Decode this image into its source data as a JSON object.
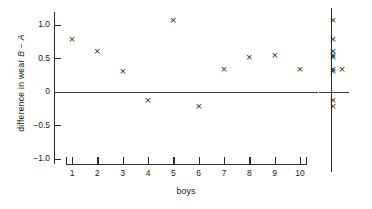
{
  "chart_data": {
    "type": "scatter",
    "title": "",
    "xlabel": "boys",
    "ylabel": "difference in wear B − A",
    "ylabel_parts": {
      "pre": "difference in wear ",
      "sym1": "B",
      "mid": " − ",
      "sym2": "A"
    },
    "categories": [
      "1",
      "2",
      "3",
      "4",
      "5",
      "6",
      "7",
      "8",
      "9",
      "10"
    ],
    "values": [
      0.78,
      0.6,
      0.3,
      -0.13,
      1.07,
      -0.22,
      0.33,
      0.52,
      0.55,
      0.33
    ],
    "xlim": [
      0.5,
      10.5
    ],
    "ylim": [
      -1.15,
      1.25
    ],
    "yticks": [
      1.0,
      0.5,
      0,
      -0.5,
      -1.0
    ],
    "ytick_labels": [
      "1.0",
      "0.5",
      "0",
      "−0.5",
      "−1.0"
    ],
    "grid": false,
    "legend": null,
    "marker_symbol": "×",
    "zero_reference_line": 0,
    "annotations": [],
    "summary_column": {
      "label": "",
      "description": "dot plot of the same differences collapsed onto one vertical axis",
      "values": [
        1.07,
        0.78,
        0.6,
        0.55,
        0.52,
        0.33,
        0.33,
        0.3,
        -0.13,
        -0.22
      ],
      "stacks": [
        {
          "value": 1.07,
          "count": 1
        },
        {
          "value": 0.78,
          "count": 1
        },
        {
          "value": 0.6,
          "count": 1
        },
        {
          "value": 0.55,
          "count": 1
        },
        {
          "value": 0.52,
          "count": 1
        },
        {
          "value": 0.33,
          "count": 2
        },
        {
          "value": 0.3,
          "count": 1
        },
        {
          "value": -0.13,
          "count": 1
        },
        {
          "value": -0.22,
          "count": 1
        }
      ]
    }
  }
}
